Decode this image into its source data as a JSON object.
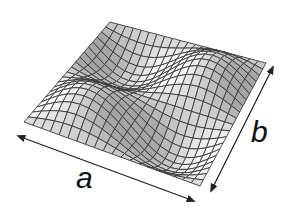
{
  "diagram": {
    "type": "3d-wireframe-surface",
    "labels": {
      "a": "a",
      "b": "b"
    },
    "surface": {
      "grid_lines_a": 20,
      "grid_lines_b": 20,
      "mode_m": 2,
      "mode_n": 2,
      "amplitude_px": 22,
      "corners": {
        "left": [
          24,
          122
        ],
        "back": [
          110,
          22
        ],
        "right": [
          266,
          63
        ],
        "front": [
          200,
          186
        ]
      },
      "line_color": "#3a3a3a",
      "fill_light": "#ffffff",
      "fill_shadow": "#9a9a9a"
    },
    "arrows": {
      "a": {
        "from": [
          18,
          136
        ],
        "to": [
          194,
          201
        ],
        "color": "#222222"
      },
      "b": {
        "from": [
          273,
          67
        ],
        "to": [
          211,
          191
        ],
        "color": "#222222"
      }
    }
  }
}
